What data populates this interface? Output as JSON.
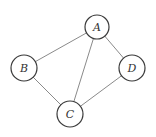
{
  "graph": {
    "nodes": [
      {
        "id": "A",
        "label": "A",
        "x": 97,
        "y": 27,
        "r": 12
      },
      {
        "id": "B",
        "label": "B",
        "x": 24,
        "y": 68,
        "r": 13
      },
      {
        "id": "C",
        "label": "C",
        "x": 70,
        "y": 114,
        "r": 13
      },
      {
        "id": "D",
        "label": "D",
        "x": 132,
        "y": 68,
        "r": 13
      }
    ],
    "edges": [
      {
        "from": "A",
        "to": "B"
      },
      {
        "from": "A",
        "to": "C"
      },
      {
        "from": "A",
        "to": "D"
      },
      {
        "from": "B",
        "to": "C"
      },
      {
        "from": "C",
        "to": "D"
      }
    ]
  }
}
